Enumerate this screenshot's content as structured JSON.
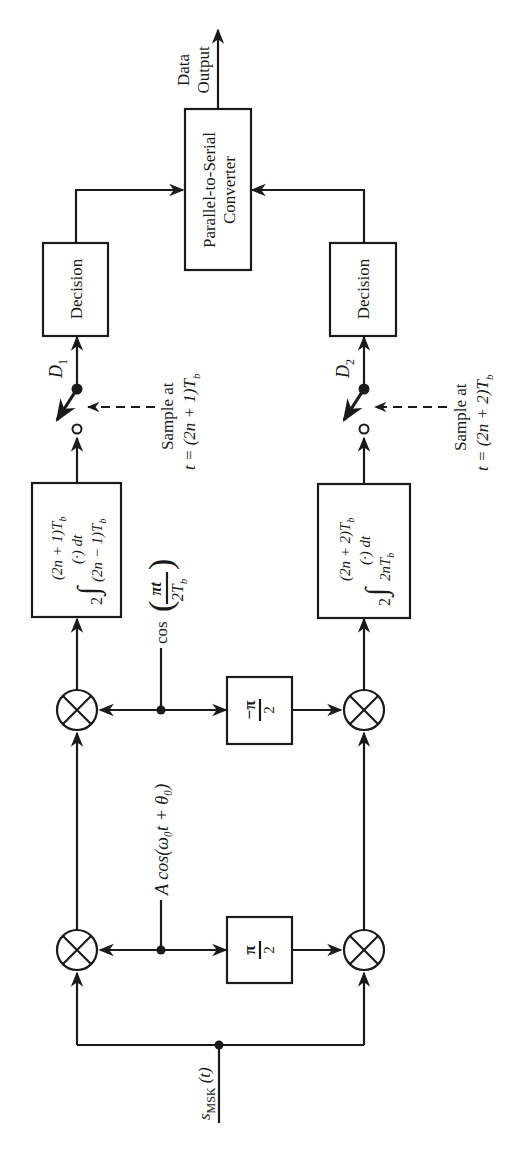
{
  "diagram": {
    "orientation": "rotated 90 degrees counter-clockwise",
    "input": {
      "label": "s",
      "subscript": "MSK",
      "suffix": "(t)"
    },
    "output": {
      "line1": "Data",
      "line2": "Output"
    },
    "carrier": {
      "label": "A cos(ω₀t + θ₀)"
    },
    "carrier_shift": {
      "label": "π",
      "denominator": "2"
    },
    "baseband": {
      "prefix": "cos",
      "numerator": "πt",
      "denominator": "2T",
      "sub": "b"
    },
    "baseband_shift": {
      "label": "−π",
      "denominator": "2"
    },
    "branch1": {
      "integrator": {
        "gain": "2",
        "upper": "(2n + 1)T",
        "lower": "(2n − 1)T",
        "sub": "b",
        "integrand": "(·) dt"
      },
      "sample": {
        "line1": "Sample at",
        "line2": "t = (2n + 1)T",
        "sub": "b"
      },
      "output_label": "D",
      "output_sub": "1",
      "decision": "Decision"
    },
    "branch2": {
      "integrator": {
        "gain": "2",
        "upper": "(2n + 2)T",
        "lower": "2nT",
        "sub": "b",
        "integrand": "(·) dt"
      },
      "sample": {
        "line1": "Sample at",
        "line2": "t = (2n + 2)T",
        "sub": "b"
      },
      "output_label": "D",
      "output_sub": "2",
      "decision": "Decision"
    },
    "converter": {
      "line1": "Parallel-to-Serial",
      "line2": "Converter"
    },
    "colors": {
      "line": "#1a1a1a",
      "background": "#ffffff"
    }
  }
}
